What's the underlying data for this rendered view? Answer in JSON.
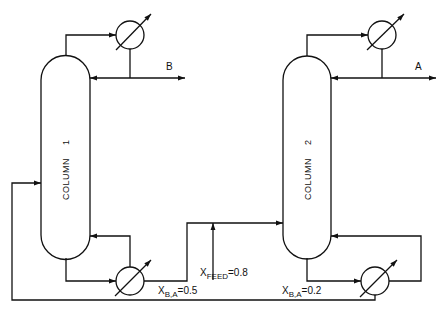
{
  "diagram": {
    "columns": [
      {
        "id": "column-1",
        "label": "COLUMN",
        "number": "1"
      },
      {
        "id": "column-2",
        "label": "COLUMN",
        "number": "2"
      }
    ],
    "products": {
      "top_1": "B",
      "top_2": "A"
    },
    "streams": {
      "feed": {
        "var": "X",
        "sub": "FEED",
        "eq": "=0.8"
      },
      "bottoms_1": {
        "var": "X",
        "sub": "B,A",
        "eq": "=0.5"
      },
      "bottoms_2": {
        "var": "X",
        "sub": "B,A",
        "eq": "=0.2"
      }
    },
    "equipment": [
      "condenser-1",
      "reboiler-1",
      "condenser-2",
      "reboiler-2"
    ],
    "colors": {
      "line": "#111111",
      "background": "#ffffff"
    }
  }
}
